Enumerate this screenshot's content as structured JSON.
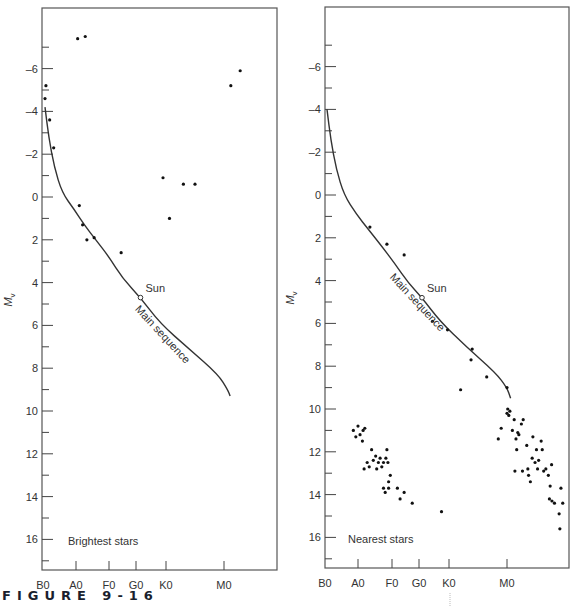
{
  "figure_caption": "FIGURE 9-16",
  "chart_data": [
    {
      "type": "scatter",
      "title": "Brightest stars",
      "ylabel": "M_v",
      "xlabel": "",
      "x_ticks": [
        "B0",
        "A0",
        "F0",
        "G0",
        "K0",
        "M0"
      ],
      "y_ticks": [
        -6,
        -4,
        -2,
        0,
        2,
        4,
        6,
        8,
        10,
        12,
        14,
        16
      ],
      "ylim": [
        -8,
        17.5
      ],
      "y_inverted": true,
      "x_units": "spectral index (B0=0, A0=1, F0=2, G0=3, K0=4, M0=5)",
      "points": [
        {
          "x": 0.03,
          "y": -5.2
        },
        {
          "x": 0.0,
          "y": -4.6
        },
        {
          "x": 0.15,
          "y": -3.6
        },
        {
          "x": 0.28,
          "y": -2.3
        },
        {
          "x": 1.05,
          "y": -7.4
        },
        {
          "x": 1.28,
          "y": -7.5
        },
        {
          "x": 1.1,
          "y": 0.4
        },
        {
          "x": 1.2,
          "y": 1.3
        },
        {
          "x": 1.33,
          "y": 2.0
        },
        {
          "x": 1.55,
          "y": 1.9
        },
        {
          "x": 2.45,
          "y": 2.6
        },
        {
          "x": 3.9,
          "y": -0.9
        },
        {
          "x": 4.06,
          "y": 1.0
        },
        {
          "x": 4.3,
          "y": -0.6
        },
        {
          "x": 4.5,
          "y": -0.6
        },
        {
          "x": 5.19,
          "y": -5.2
        },
        {
          "x": 5.45,
          "y": -5.9
        }
      ],
      "sun": {
        "x": 3.15,
        "y": 4.7,
        "label": "Sun"
      },
      "main_sequence": {
        "label": "Main sequence",
        "curve": [
          [
            0.0,
            -4.2
          ],
          [
            0.12,
            -2.8
          ],
          [
            0.3,
            -1.4
          ],
          [
            0.55,
            -0.2
          ],
          [
            0.95,
            0.6
          ],
          [
            1.25,
            1.3
          ],
          [
            1.6,
            2.0
          ],
          [
            2.0,
            2.8
          ],
          [
            2.5,
            3.8
          ],
          [
            3.15,
            4.7
          ],
          [
            3.8,
            5.9
          ],
          [
            4.4,
            7.1
          ],
          [
            4.9,
            8.3
          ],
          [
            5.1,
            9.0
          ],
          [
            5.17,
            9.3
          ]
        ]
      }
    },
    {
      "type": "scatter",
      "title": "Nearest stars",
      "ylabel": "M_v",
      "xlabel": "",
      "x_ticks": [
        "B0",
        "A0",
        "F0",
        "G0",
        "K0",
        "M0"
      ],
      "y_ticks": [
        -6,
        -4,
        -2,
        0,
        2,
        4,
        6,
        8,
        10,
        12,
        14,
        16
      ],
      "ylim": [
        -8,
        17.5
      ],
      "y_inverted": true,
      "x_units": "spectral index (B0=0, A0=1, F0=2, G0=3, K0=4, M0=5)",
      "points": [
        {
          "x": 1.35,
          "y": 1.5
        },
        {
          "x": 1.85,
          "y": 2.3
        },
        {
          "x": 2.45,
          "y": 2.8
        },
        {
          "x": 3.45,
          "y": 5.9
        },
        {
          "x": 3.95,
          "y": 6.3
        },
        {
          "x": 4.4,
          "y": 7.2
        },
        {
          "x": 4.38,
          "y": 7.7
        },
        {
          "x": 4.65,
          "y": 8.5
        },
        {
          "x": 4.2,
          "y": 9.1
        },
        {
          "x": 5.0,
          "y": 9.0
        },
        {
          "x": 0.85,
          "y": 11.0
        },
        {
          "x": 0.93,
          "y": 11.3
        },
        {
          "x": 1.0,
          "y": 10.8
        },
        {
          "x": 1.06,
          "y": 11.2
        },
        {
          "x": 1.15,
          "y": 11.0
        },
        {
          "x": 1.2,
          "y": 10.9
        },
        {
          "x": 1.13,
          "y": 11.5
        },
        {
          "x": 1.18,
          "y": 12.8
        },
        {
          "x": 1.27,
          "y": 12.5
        },
        {
          "x": 1.33,
          "y": 12.7
        },
        {
          "x": 1.4,
          "y": 11.9
        },
        {
          "x": 1.45,
          "y": 12.4
        },
        {
          "x": 1.52,
          "y": 12.2
        },
        {
          "x": 1.55,
          "y": 12.8
        },
        {
          "x": 1.6,
          "y": 12.5
        },
        {
          "x": 1.65,
          "y": 12.3
        },
        {
          "x": 1.7,
          "y": 12.7
        },
        {
          "x": 1.75,
          "y": 12.5
        },
        {
          "x": 1.82,
          "y": 12.3
        },
        {
          "x": 1.88,
          "y": 12.5
        },
        {
          "x": 1.85,
          "y": 11.9
        },
        {
          "x": 1.95,
          "y": 13.1
        },
        {
          "x": 1.9,
          "y": 13.4
        },
        {
          "x": 1.75,
          "y": 13.7
        },
        {
          "x": 1.8,
          "y": 13.9
        },
        {
          "x": 1.9,
          "y": 13.7
        },
        {
          "x": 2.2,
          "y": 13.7
        },
        {
          "x": 2.3,
          "y": 14.2
        },
        {
          "x": 2.45,
          "y": 13.9
        },
        {
          "x": 2.75,
          "y": 14.4
        },
        {
          "x": 3.75,
          "y": 14.8
        },
        {
          "x": 4.85,
          "y": 11.4
        },
        {
          "x": 4.9,
          "y": 10.9
        },
        {
          "x": 5.0,
          "y": 10.2
        },
        {
          "x": 5.02,
          "y": 10.0
        },
        {
          "x": 5.05,
          "y": 10.3
        },
        {
          "x": 5.08,
          "y": 10.1
        },
        {
          "x": 5.15,
          "y": 11.0
        },
        {
          "x": 5.2,
          "y": 10.5
        },
        {
          "x": 5.22,
          "y": 12.9
        },
        {
          "x": 5.25,
          "y": 11.4
        },
        {
          "x": 5.27,
          "y": 11.9
        },
        {
          "x": 5.3,
          "y": 11.1
        },
        {
          "x": 5.33,
          "y": 11.2
        },
        {
          "x": 5.4,
          "y": 10.7
        },
        {
          "x": 5.45,
          "y": 10.5
        },
        {
          "x": 5.43,
          "y": 12.9
        },
        {
          "x": 5.55,
          "y": 11.7
        },
        {
          "x": 5.6,
          "y": 13.1
        },
        {
          "x": 5.58,
          "y": 12.8
        },
        {
          "x": 5.65,
          "y": 13.4
        },
        {
          "x": 5.7,
          "y": 12.3
        },
        {
          "x": 5.72,
          "y": 11.3
        },
        {
          "x": 5.78,
          "y": 12.5
        },
        {
          "x": 5.82,
          "y": 11.9
        },
        {
          "x": 5.85,
          "y": 12.8
        },
        {
          "x": 5.88,
          "y": 12.4
        },
        {
          "x": 5.95,
          "y": 11.5
        },
        {
          "x": 5.98,
          "y": 11.9
        },
        {
          "x": 6.02,
          "y": 12.9
        },
        {
          "x": 6.08,
          "y": 12.8
        },
        {
          "x": 6.15,
          "y": 13.1
        },
        {
          "x": 6.2,
          "y": 13.6
        },
        {
          "x": 6.24,
          "y": 12.6
        },
        {
          "x": 6.25,
          "y": 14.3
        },
        {
          "x": 6.32,
          "y": 14.4
        },
        {
          "x": 6.18,
          "y": 14.2
        },
        {
          "x": 6.45,
          "y": 14.9
        },
        {
          "x": 6.5,
          "y": 13.7
        },
        {
          "x": 6.55,
          "y": 14.4
        },
        {
          "x": 6.47,
          "y": 15.6
        }
      ],
      "sun": {
        "x": 3.1,
        "y": 4.8,
        "label": "Sun"
      },
      "main_sequence": {
        "label": "Main sequence",
        "curve": [
          [
            0.0,
            -4.0
          ],
          [
            0.12,
            -2.6
          ],
          [
            0.3,
            -1.2
          ],
          [
            0.55,
            0.0
          ],
          [
            0.95,
            0.9
          ],
          [
            1.3,
            1.6
          ],
          [
            1.7,
            2.4
          ],
          [
            2.1,
            3.2
          ],
          [
            2.6,
            4.1
          ],
          [
            3.1,
            4.8
          ],
          [
            3.7,
            5.9
          ],
          [
            4.3,
            7.1
          ],
          [
            4.8,
            8.3
          ],
          [
            5.0,
            9.0
          ],
          [
            5.1,
            9.5
          ]
        ]
      }
    }
  ],
  "panels": [
    {
      "label": "Brightest stars",
      "sun_label": "Sun",
      "ms_label": "Main sequence",
      "ylabel_main": "M",
      "ylabel_sub": "v"
    },
    {
      "label": "Nearest stars",
      "sun_label": "Sun",
      "ms_label": "Main sequence",
      "ylabel_main": "M",
      "ylabel_sub": "v"
    }
  ]
}
